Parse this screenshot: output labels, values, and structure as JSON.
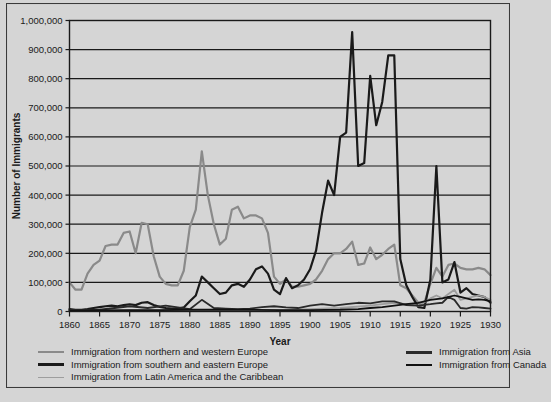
{
  "figure": {
    "background_color": "#d5d5d5",
    "border_color": "#3a3a3a"
  },
  "chart_data": {
    "type": "line",
    "title": "",
    "xlabel": "Year",
    "ylabel": "Number of Immigrants",
    "xlim": [
      1860,
      1930
    ],
    "ylim": [
      0,
      1000000
    ],
    "grid": true,
    "legend_position": "below",
    "xticks": [
      1860,
      1865,
      1870,
      1875,
      1880,
      1885,
      1890,
      1895,
      1900,
      1905,
      1910,
      1915,
      1920,
      1925,
      1930
    ],
    "xtick_labels": [
      "1860",
      "1865",
      "1870",
      "1875",
      "1880",
      "1885",
      "1890",
      "1895",
      "1900",
      "1905",
      "1910",
      "1915",
      "1920",
      "1925",
      "1930"
    ],
    "yticks": [
      0,
      100000,
      200000,
      300000,
      400000,
      500000,
      600000,
      700000,
      800000,
      900000,
      1000000
    ],
    "ytick_labels": [
      "0",
      "100,000",
      "200,000",
      "300,000",
      "400,000",
      "500,000",
      "600,000",
      "700,000",
      "800,000",
      "900,000",
      "1,000,000"
    ],
    "series": [
      {
        "name": "Immigration from northern and western Europe",
        "color": "#8a8a8a",
        "width": 2.2,
        "x": [
          1860,
          1861,
          1862,
          1863,
          1864,
          1865,
          1866,
          1867,
          1868,
          1869,
          1870,
          1871,
          1872,
          1873,
          1874,
          1875,
          1876,
          1877,
          1878,
          1879,
          1880,
          1881,
          1882,
          1883,
          1884,
          1885,
          1886,
          1887,
          1888,
          1889,
          1890,
          1891,
          1892,
          1893,
          1894,
          1895,
          1896,
          1897,
          1898,
          1899,
          1900,
          1901,
          1902,
          1903,
          1904,
          1905,
          1906,
          1907,
          1908,
          1909,
          1910,
          1911,
          1912,
          1913,
          1914,
          1915,
          1916,
          1917,
          1918,
          1919,
          1920,
          1921,
          1922,
          1923,
          1924,
          1925,
          1926,
          1927,
          1928,
          1929,
          1930
        ],
        "y": [
          100000,
          75000,
          75000,
          130000,
          160000,
          175000,
          225000,
          230000,
          230000,
          270000,
          275000,
          200000,
          305000,
          300000,
          190000,
          120000,
          95000,
          90000,
          90000,
          140000,
          290000,
          350000,
          550000,
          400000,
          300000,
          230000,
          250000,
          350000,
          360000,
          320000,
          330000,
          330000,
          320000,
          270000,
          120000,
          95000,
          110000,
          85000,
          85000,
          90000,
          95000,
          110000,
          140000,
          180000,
          200000,
          200000,
          215000,
          240000,
          160000,
          165000,
          220000,
          180000,
          195000,
          215000,
          230000,
          90000,
          80000,
          55000,
          30000,
          30000,
          95000,
          150000,
          120000,
          160000,
          165000,
          150000,
          145000,
          145000,
          150000,
          145000,
          125000
        ]
      },
      {
        "name": "Immigration from southern and eastern Europe",
        "color": "#1a1a1a",
        "width": 2.2,
        "x": [
          1860,
          1861,
          1862,
          1863,
          1864,
          1865,
          1866,
          1867,
          1868,
          1869,
          1870,
          1871,
          1872,
          1873,
          1874,
          1875,
          1876,
          1877,
          1878,
          1879,
          1880,
          1881,
          1882,
          1883,
          1884,
          1885,
          1886,
          1887,
          1888,
          1889,
          1890,
          1891,
          1892,
          1893,
          1894,
          1895,
          1896,
          1897,
          1898,
          1899,
          1900,
          1901,
          1902,
          1903,
          1904,
          1905,
          1906,
          1907,
          1908,
          1909,
          1910,
          1911,
          1912,
          1913,
          1914,
          1915,
          1916,
          1917,
          1918,
          1919,
          1920,
          1921,
          1922,
          1923,
          1924,
          1925,
          1926,
          1927,
          1928,
          1929,
          1930
        ],
        "y": [
          8000,
          6000,
          6000,
          8000,
          12000,
          15000,
          18000,
          20000,
          18000,
          22000,
          25000,
          22000,
          30000,
          32000,
          22000,
          16000,
          12000,
          10000,
          10000,
          14000,
          35000,
          55000,
          120000,
          100000,
          80000,
          60000,
          65000,
          90000,
          95000,
          85000,
          110000,
          145000,
          155000,
          130000,
          75000,
          60000,
          115000,
          80000,
          90000,
          110000,
          145000,
          210000,
          340000,
          450000,
          400000,
          600000,
          615000,
          960000,
          500000,
          510000,
          810000,
          640000,
          720000,
          880000,
          880000,
          180000,
          90000,
          50000,
          15000,
          12000,
          110000,
          500000,
          100000,
          110000,
          170000,
          65000,
          80000,
          60000,
          55000,
          50000,
          30000
        ]
      },
      {
        "name": "Immigration from Latin America and the Caribbean",
        "color": "#9d9d9d",
        "width": 1.8,
        "x": [
          1860,
          1865,
          1870,
          1875,
          1880,
          1885,
          1890,
          1895,
          1900,
          1905,
          1910,
          1912,
          1914,
          1916,
          1918,
          1920,
          1921,
          1922,
          1923,
          1924,
          1925,
          1926,
          1927,
          1928,
          1929,
          1930
        ],
        "y": [
          3000,
          4000,
          5000,
          4000,
          5000,
          6000,
          6000,
          5000,
          8000,
          12000,
          20000,
          25000,
          30000,
          25000,
          20000,
          45000,
          55000,
          45000,
          60000,
          75000,
          40000,
          45000,
          50000,
          55000,
          50000,
          40000
        ]
      },
      {
        "name": "Immigration from Asia",
        "color": "#2a2a2a",
        "width": 1.8,
        "x": [
          1860,
          1865,
          1870,
          1873,
          1876,
          1880,
          1882,
          1884,
          1886,
          1888,
          1890,
          1892,
          1894,
          1896,
          1898,
          1900,
          1902,
          1904,
          1906,
          1908,
          1910,
          1912,
          1914,
          1916,
          1918,
          1920,
          1921,
          1922,
          1923,
          1924,
          1925,
          1926,
          1927,
          1928,
          1929,
          1930
        ],
        "y": [
          5000,
          6000,
          18000,
          12000,
          20000,
          8000,
          40000,
          12000,
          10000,
          8000,
          10000,
          15000,
          18000,
          14000,
          12000,
          20000,
          25000,
          20000,
          25000,
          30000,
          28000,
          35000,
          35000,
          22000,
          20000,
          25000,
          28000,
          30000,
          50000,
          40000,
          12000,
          10000,
          15000,
          14000,
          12000,
          10000
        ]
      },
      {
        "name": "Immigration from Canada",
        "color": "#111111",
        "width": 1.8,
        "x": [
          1860,
          1865,
          1870,
          1875,
          1880,
          1885,
          1890,
          1895,
          1900,
          1905,
          1908,
          1910,
          1912,
          1914,
          1916,
          1918,
          1920,
          1922,
          1924,
          1925,
          1926,
          1927,
          1928,
          1929,
          1930
        ],
        "y": [
          3000,
          4000,
          5000,
          5000,
          6000,
          6000,
          6000,
          5000,
          5000,
          6000,
          8000,
          12000,
          15000,
          20000,
          25000,
          30000,
          40000,
          45000,
          55000,
          50000,
          45000,
          40000,
          42000,
          40000,
          35000
        ]
      }
    ]
  },
  "legend": {
    "left_column": [
      {
        "label": "Immigration from northern and western Europe",
        "color": "#8a8a8a",
        "thickness": 2.2
      },
      {
        "label": "Immigration from southern and eastern Europe",
        "color": "#1a1a1a",
        "thickness": 3.2
      },
      {
        "label": "Immigration from Latin America and the Caribbean",
        "color": "#9d9d9d",
        "thickness": 1.8
      }
    ],
    "right_column": [
      {
        "label": "Immigration from Asia",
        "color": "#2a2a2a",
        "thickness": 3.0
      },
      {
        "label": "Immigration from Canada",
        "color": "#111111",
        "thickness": 2.6
      }
    ]
  }
}
